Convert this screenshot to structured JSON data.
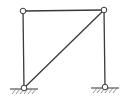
{
  "diagram": {
    "type": "structural-frame",
    "colors": {
      "member": "#3a3a3a",
      "node_fill": "#ffffff",
      "node_stroke": "#3a3a3a",
      "ground": "#555555",
      "background": "#ffffff"
    },
    "nodes": [
      {
        "id": "A",
        "x": 24,
        "y": 88,
        "label": "",
        "type": "pin-support"
      },
      {
        "id": "B",
        "x": 105,
        "y": 87,
        "label": "",
        "type": "pin-support"
      },
      {
        "id": "C",
        "x": 23,
        "y": 11,
        "label": "",
        "type": "hinge"
      },
      {
        "id": "D",
        "x": 104,
        "y": 10,
        "label": "",
        "type": "hinge"
      }
    ],
    "members": [
      {
        "from": "A",
        "to": "C",
        "name": "left-column"
      },
      {
        "from": "C",
        "to": "D",
        "name": "top-beam"
      },
      {
        "from": "D",
        "to": "B",
        "name": "right-column"
      },
      {
        "from": "A",
        "to": "D",
        "name": "diagonal-brace"
      }
    ],
    "supports": [
      {
        "node": "A",
        "kind": "pinned",
        "ground_x1": 10,
        "ground_x2": 38,
        "ground_y": 89
      },
      {
        "node": "B",
        "kind": "pinned",
        "ground_x1": 91,
        "ground_x2": 119,
        "ground_y": 88
      }
    ]
  }
}
